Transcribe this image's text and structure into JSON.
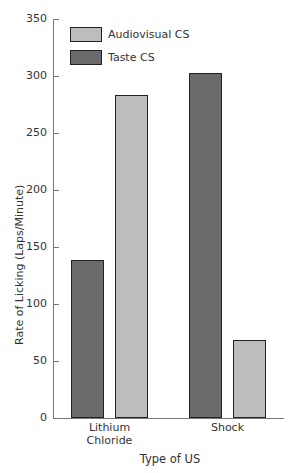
{
  "chart_data": {
    "type": "bar",
    "title": "",
    "xlabel": "Type of US",
    "ylabel": "Rate of Licking (Laps/Minute)",
    "ylim": [
      0,
      350
    ],
    "yticks": [
      0,
      50,
      100,
      150,
      200,
      250,
      300,
      350
    ],
    "categories": [
      "Lithium Chloride",
      "Shock"
    ],
    "category_lines": [
      [
        "Lithium",
        "Chloride"
      ],
      [
        "Shock"
      ]
    ],
    "series": [
      {
        "name": "Taste CS",
        "color": "#6b6b6b",
        "values": [
          139,
          303
        ]
      },
      {
        "name": "Audiovisual CS",
        "color": "#bdbdbd",
        "values": [
          283,
          68
        ]
      }
    ],
    "legend": {
      "position": "upper left inside",
      "entries": [
        {
          "label": "Audiovisual CS",
          "color": "#bdbdbd"
        },
        {
          "label": "Taste CS",
          "color": "#6b6b6b"
        }
      ]
    },
    "grid": false
  }
}
